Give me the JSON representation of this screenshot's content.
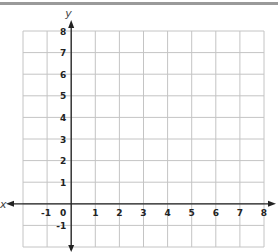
{
  "chart_data": {
    "type": "coordinate-grid",
    "title": "",
    "xlabel": "x",
    "ylabel": "y",
    "xlim": [
      -2,
      8
    ],
    "ylim": [
      -2,
      8
    ],
    "grid": true,
    "x_ticks": [
      "-1",
      "0",
      "1",
      "2",
      "3",
      "4",
      "5",
      "6",
      "7",
      "8"
    ],
    "x_tick_values": [
      -1,
      0,
      1,
      2,
      3,
      4,
      5,
      6,
      7,
      8
    ],
    "y_ticks": [
      "8",
      "7",
      "6",
      "5",
      "4",
      "3",
      "2",
      "1",
      "-1"
    ],
    "y_tick_values": [
      8,
      7,
      6,
      5,
      4,
      3,
      2,
      1,
      -1
    ],
    "colors": {
      "grid": "#c4c4c4",
      "axis": "#222222",
      "border": "#9a9a9a"
    }
  }
}
